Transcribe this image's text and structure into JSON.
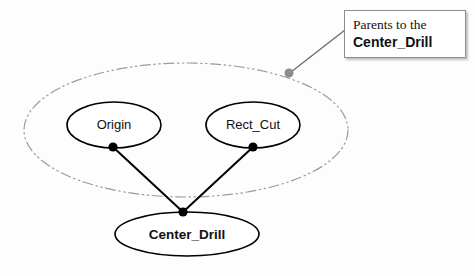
{
  "diagram": {
    "background_color": "#fdfdfd",
    "group_ellipse": {
      "name": "parents-group",
      "cx": 186,
      "cy": 130,
      "rx": 162,
      "ry": 67,
      "stroke": "#9a9aa8",
      "style": "dash-dot-dot"
    },
    "nodes": [
      {
        "id": "origin",
        "label": "Origin",
        "cx": 114,
        "cy": 125,
        "rx": 47,
        "ry": 23,
        "bold": false,
        "stroke": "#000000",
        "fill": "#ffffff",
        "port": {
          "x": 113,
          "y": 147
        }
      },
      {
        "id": "rect_cut",
        "label": "Rect_Cut",
        "cx": 253,
        "cy": 125,
        "rx": 47,
        "ry": 23,
        "bold": false,
        "stroke": "#000000",
        "fill": "#ffffff",
        "port": {
          "x": 253,
          "y": 147
        }
      },
      {
        "id": "center_drill",
        "label": "Center_Drill",
        "cx": 187,
        "cy": 234,
        "rx": 72,
        "ry": 22,
        "bold": true,
        "stroke": "#000000",
        "fill": "#ffffff",
        "port": {
          "x": 183,
          "y": 212
        }
      }
    ],
    "edges": [
      {
        "id": "origin-to-center-drill",
        "from": "origin",
        "to": "center_drill",
        "x1": 113,
        "y1": 147,
        "x2": 183,
        "y2": 212,
        "stroke": "#000000"
      },
      {
        "id": "rect-cut-to-center-drill",
        "from": "rect_cut",
        "to": "center_drill",
        "x1": 253,
        "y1": 147,
        "x2": 183,
        "y2": 212,
        "stroke": "#000000"
      }
    ],
    "annotation": {
      "line_1": "Parents to the",
      "line_2": "Center_Drill",
      "leader": {
        "x1": 289,
        "y1": 73,
        "x2": 344,
        "y2": 30,
        "stroke": "#6e6e6e"
      },
      "anchor_dot": {
        "cx": 289,
        "cy": 73,
        "r": 4.5,
        "fill": "#8c8c8c"
      },
      "box_border_color": "#8d8d8d"
    }
  }
}
